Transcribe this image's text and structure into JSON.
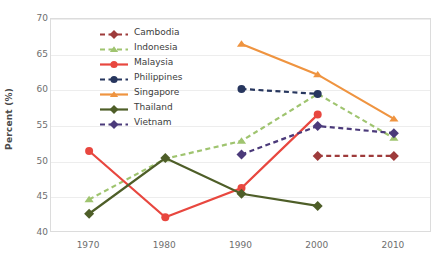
{
  "chart_data": {
    "type": "line",
    "title": "",
    "xlabel": "",
    "ylabel": "Percent (%)",
    "x": [
      1970,
      1980,
      1990,
      2000,
      2010
    ],
    "xtick_labels": [
      "1970",
      "1980",
      "1990",
      "2000",
      "2010"
    ],
    "ytick_labels": [
      "40",
      "45",
      "50",
      "55",
      "60",
      "65",
      "70"
    ],
    "yticks": [
      40,
      45,
      50,
      55,
      60,
      65,
      70
    ],
    "ylim": [
      40,
      70
    ],
    "xlim": [
      1965,
      2015
    ],
    "grid": "horizontal",
    "legend_position": "upper-center-left-inside",
    "series": [
      {
        "name": "Cambodia",
        "color": "#9e3b3b",
        "linestyle": "dashed",
        "marker": "diamond",
        "x": [
          2000,
          2010
        ],
        "values": [
          50.8,
          50.8
        ]
      },
      {
        "name": "Indonesia",
        "color": "#9fc island",
        "linestyle": "dashed",
        "marker": "triangle",
        "x": [
          1970,
          1980,
          1990,
          2000,
          2010
        ],
        "values": [
          44.7,
          50.4,
          52.9,
          59.5,
          53.3
        ]
      },
      {
        "name": "Malaysia",
        "color": "#e8473f",
        "linestyle": "solid",
        "marker": "circle",
        "x": [
          1970,
          1980,
          1990,
          2000
        ],
        "values": [
          51.5,
          42.2,
          46.3,
          56.6
        ]
      },
      {
        "name": "Philippines",
        "color": "#27365e",
        "linestyle": "dashed",
        "marker": "circle",
        "x": [
          1990,
          2000
        ],
        "values": [
          60.2,
          59.5
        ]
      },
      {
        "name": "Singapore",
        "color": "#ef9440",
        "linestyle": "solid",
        "marker": "triangle",
        "x": [
          1990,
          2000,
          2010
        ],
        "values": [
          66.5,
          62.2,
          56.0
        ]
      },
      {
        "name": "Thailand",
        "color": "#4e5e28",
        "linestyle": "solid",
        "marker": "diamond",
        "x": [
          1970,
          1980,
          1990,
          2000
        ],
        "values": [
          42.7,
          50.5,
          45.5,
          43.8
        ]
      },
      {
        "name": "Vietnam",
        "color": "#4b3a7a",
        "linestyle": "dashed",
        "marker": "diamond",
        "x": [
          1990,
          2000,
          2010
        ],
        "values": [
          51.0,
          55.0,
          54.0
        ]
      }
    ]
  },
  "colors": {
    "grid": "#ededed",
    "frame": "#dcdcdc",
    "tick_text": "#6e6e6e",
    "axis_title": "#4a4a4a",
    "legend_text": "#3c3c3c",
    "background": "#ffffff"
  }
}
